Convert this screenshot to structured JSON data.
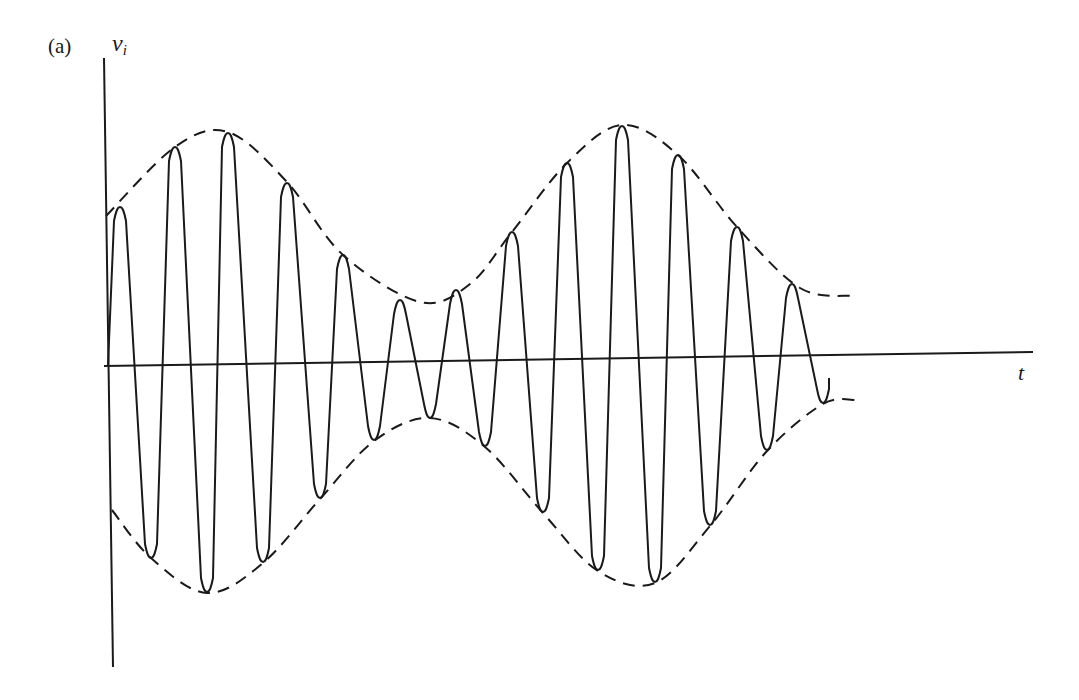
{
  "figure": {
    "panel_label": "(a)",
    "y_axis_label": "v",
    "y_axis_subscript": "i",
    "x_axis_label": "t",
    "colors": {
      "line": "#1a1a1a",
      "background": "#ffffff"
    }
  },
  "chart_data": {
    "type": "line",
    "title": "(a)",
    "xlabel": "t",
    "ylabel": "v_i",
    "grid": false,
    "series": [
      {
        "name": "carrier",
        "style": "solid",
        "peaks_px": [
          [
            120,
            207
          ],
          [
            175,
            147
          ],
          [
            228,
            133
          ],
          [
            287,
            183
          ],
          [
            343,
            255
          ],
          [
            400,
            300
          ],
          [
            456,
            290
          ],
          [
            512,
            232
          ],
          [
            567,
            163
          ],
          [
            622,
            126
          ],
          [
            678,
            155
          ],
          [
            737,
            227
          ],
          [
            792,
            284
          ]
        ],
        "troughs_px": [
          [
            151,
            558
          ],
          [
            207,
            592
          ],
          [
            263,
            562
          ],
          [
            320,
            498
          ],
          [
            374,
            440
          ],
          [
            430,
            418
          ],
          [
            485,
            446
          ],
          [
            543,
            512
          ],
          [
            598,
            570
          ],
          [
            655,
            582
          ],
          [
            710,
            525
          ],
          [
            767,
            450
          ],
          [
            823,
            403
          ]
        ]
      },
      {
        "name": "upper-envelope",
        "style": "dashed",
        "points_px": [
          [
            106,
            216
          ],
          [
            175,
            147
          ],
          [
            228,
            132
          ],
          [
            287,
            182
          ],
          [
            343,
            255
          ],
          [
            420,
            302
          ],
          [
            470,
            284
          ],
          [
            512,
            232
          ],
          [
            567,
            163
          ],
          [
            622,
            125
          ],
          [
            678,
            155
          ],
          [
            737,
            227
          ],
          [
            800,
            288
          ],
          [
            853,
            296
          ]
        ]
      },
      {
        "name": "lower-envelope",
        "style": "dashed",
        "points_px": [
          [
            112,
            510
          ],
          [
            151,
            558
          ],
          [
            207,
            593
          ],
          [
            263,
            563
          ],
          [
            320,
            499
          ],
          [
            374,
            441
          ],
          [
            430,
            418
          ],
          [
            485,
            447
          ],
          [
            543,
            513
          ],
          [
            598,
            571
          ],
          [
            655,
            583
          ],
          [
            710,
            526
          ],
          [
            767,
            451
          ],
          [
            823,
            404
          ],
          [
            857,
            400
          ]
        ]
      }
    ]
  }
}
